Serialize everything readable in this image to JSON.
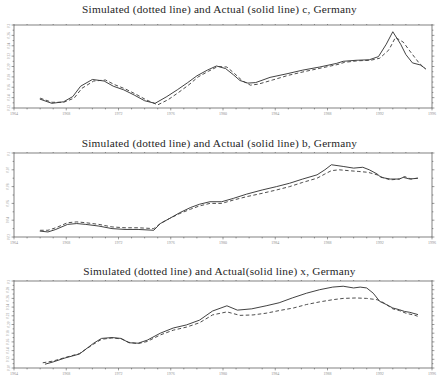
{
  "page": {
    "background": "#ffffff",
    "frame_color": "#4a4a4a",
    "solid_line_color": "#2d2d2d",
    "dashed_line_color": "#3a3a3a"
  },
  "chart_data": [
    {
      "type": "line",
      "id": "c",
      "title": "Simulated (dotted line) and Actual (solid line) c, Germany",
      "xlabel": "",
      "ylabel": "",
      "x_range": [
        1964,
        1996
      ],
      "x_tick_labels": [
        "1964",
        "1968",
        "1972",
        "1976",
        "1980",
        "1984",
        "1988",
        "1992",
        "1996"
      ],
      "ylim": [
        0.12,
        0.28
      ],
      "y_tick_labels": [
        "0.12",
        "0.14",
        "0.16",
        "0.18",
        "0.20",
        "0.22",
        "0.24",
        "0.26",
        "0.28"
      ],
      "grid": false,
      "legend_position": "none",
      "series": [
        {
          "name": "Actual",
          "style": "solid",
          "points": [
            [
              1966.0,
              0.137
            ],
            [
              1966.9,
              0.129
            ],
            [
              1967.8,
              0.132
            ],
            [
              1968.5,
              0.142
            ],
            [
              1969.1,
              0.162
            ],
            [
              1970.0,
              0.175
            ],
            [
              1970.9,
              0.172
            ],
            [
              1971.6,
              0.162
            ],
            [
              1972.4,
              0.155
            ],
            [
              1973.2,
              0.145
            ],
            [
              1974.0,
              0.134
            ],
            [
              1974.8,
              0.129
            ],
            [
              1975.7,
              0.142
            ],
            [
              1976.5,
              0.155
            ],
            [
              1977.3,
              0.169
            ],
            [
              1978.0,
              0.182
            ],
            [
              1978.8,
              0.193
            ],
            [
              1979.5,
              0.201
            ],
            [
              1980.2,
              0.196
            ],
            [
              1980.8,
              0.184
            ],
            [
              1981.3,
              0.173
            ],
            [
              1981.9,
              0.168
            ],
            [
              1982.5,
              0.169
            ],
            [
              1983.6,
              0.179
            ],
            [
              1984.9,
              0.186
            ],
            [
              1986.1,
              0.193
            ],
            [
              1987.4,
              0.199
            ],
            [
              1988.7,
              0.206
            ],
            [
              1989.2,
              0.21
            ],
            [
              1990.2,
              0.212
            ],
            [
              1991.2,
              0.213
            ],
            [
              1991.9,
              0.219
            ],
            [
              1992.5,
              0.243
            ],
            [
              1993.0,
              0.267
            ],
            [
              1993.6,
              0.243
            ],
            [
              1994.0,
              0.223
            ],
            [
              1994.5,
              0.207
            ],
            [
              1995.1,
              0.203
            ],
            [
              1995.5,
              0.196
            ]
          ]
        },
        {
          "name": "Simulated",
          "style": "dashed",
          "points": [
            [
              1966.0,
              0.139
            ],
            [
              1966.9,
              0.131
            ],
            [
              1967.8,
              0.131
            ],
            [
              1968.6,
              0.139
            ],
            [
              1969.2,
              0.158
            ],
            [
              1970.1,
              0.172
            ],
            [
              1971.0,
              0.174
            ],
            [
              1971.7,
              0.165
            ],
            [
              1972.5,
              0.157
            ],
            [
              1973.3,
              0.147
            ],
            [
              1974.1,
              0.136
            ],
            [
              1975.0,
              0.126
            ],
            [
              1975.8,
              0.136
            ],
            [
              1976.6,
              0.15
            ],
            [
              1977.4,
              0.165
            ],
            [
              1978.1,
              0.18
            ],
            [
              1978.9,
              0.191
            ],
            [
              1979.6,
              0.2
            ],
            [
              1980.3,
              0.199
            ],
            [
              1980.9,
              0.186
            ],
            [
              1981.5,
              0.172
            ],
            [
              1982.1,
              0.164
            ],
            [
              1982.7,
              0.166
            ],
            [
              1983.8,
              0.174
            ],
            [
              1985.0,
              0.183
            ],
            [
              1986.2,
              0.19
            ],
            [
              1987.5,
              0.197
            ],
            [
              1988.8,
              0.204
            ],
            [
              1989.3,
              0.208
            ],
            [
              1990.3,
              0.211
            ],
            [
              1991.3,
              0.212
            ],
            [
              1992.0,
              0.216
            ],
            [
              1992.7,
              0.232
            ],
            [
              1993.2,
              0.256
            ],
            [
              1993.8,
              0.247
            ],
            [
              1994.3,
              0.23
            ],
            [
              1995.0,
              0.207
            ],
            [
              1995.5,
              0.195
            ]
          ]
        }
      ]
    },
    {
      "type": "line",
      "id": "b",
      "title": "Simulated (dotted line) and Actual (solid line) b, Germany",
      "xlabel": "",
      "ylabel": "",
      "x_range": [
        1964,
        1996
      ],
      "x_tick_labels": [
        "1964",
        "1968",
        "1972",
        "1976",
        "1980",
        "1984",
        "1988",
        "1992",
        "1996"
      ],
      "ylim": [
        0.02,
        0.12
      ],
      "y_tick_labels": [
        "0.02",
        "0.04",
        "0.06",
        "0.08",
        "0.10",
        "0.12"
      ],
      "grid": false,
      "legend_position": "none",
      "series": [
        {
          "name": "Actual",
          "style": "solid",
          "points": [
            [
              1966.0,
              0.027
            ],
            [
              1966.6,
              0.026
            ],
            [
              1967.2,
              0.029
            ],
            [
              1968.1,
              0.035
            ],
            [
              1968.8,
              0.036
            ],
            [
              1969.5,
              0.035
            ],
            [
              1970.5,
              0.033
            ],
            [
              1971.5,
              0.03
            ],
            [
              1972.5,
              0.029
            ],
            [
              1973.5,
              0.029
            ],
            [
              1974.7,
              0.028
            ],
            [
              1975.2,
              0.036
            ],
            [
              1975.9,
              0.042
            ],
            [
              1976.7,
              0.049
            ],
            [
              1977.5,
              0.055
            ],
            [
              1978.2,
              0.059
            ],
            [
              1979.0,
              0.062
            ],
            [
              1979.9,
              0.062
            ],
            [
              1980.8,
              0.066
            ],
            [
              1981.8,
              0.071
            ],
            [
              1983.0,
              0.076
            ],
            [
              1984.1,
              0.08
            ],
            [
              1985.1,
              0.084
            ],
            [
              1986.1,
              0.089
            ],
            [
              1987.2,
              0.094
            ],
            [
              1987.8,
              0.1
            ],
            [
              1988.3,
              0.106
            ],
            [
              1989.2,
              0.104
            ],
            [
              1990.0,
              0.102
            ],
            [
              1990.7,
              0.103
            ],
            [
              1991.2,
              0.1
            ],
            [
              1991.8,
              0.095
            ],
            [
              1992.1,
              0.091
            ],
            [
              1992.8,
              0.089
            ],
            [
              1993.5,
              0.089
            ],
            [
              1993.8,
              0.091
            ],
            [
              1994.3,
              0.089
            ],
            [
              1994.9,
              0.09
            ]
          ]
        },
        {
          "name": "Simulated",
          "style": "dashed",
          "points": [
            [
              1966.0,
              0.028
            ],
            [
              1966.6,
              0.028
            ],
            [
              1967.2,
              0.031
            ],
            [
              1968.1,
              0.037
            ],
            [
              1968.8,
              0.038
            ],
            [
              1969.5,
              0.037
            ],
            [
              1970.5,
              0.035
            ],
            [
              1971.5,
              0.032
            ],
            [
              1972.5,
              0.031
            ],
            [
              1973.5,
              0.031
            ],
            [
              1974.7,
              0.03
            ],
            [
              1975.2,
              0.036
            ],
            [
              1975.9,
              0.042
            ],
            [
              1976.7,
              0.048
            ],
            [
              1977.5,
              0.053
            ],
            [
              1978.2,
              0.057
            ],
            [
              1979.0,
              0.06
            ],
            [
              1979.9,
              0.06
            ],
            [
              1980.8,
              0.064
            ],
            [
              1981.8,
              0.068
            ],
            [
              1983.0,
              0.072
            ],
            [
              1984.1,
              0.076
            ],
            [
              1985.1,
              0.08
            ],
            [
              1986.1,
              0.085
            ],
            [
              1987.2,
              0.09
            ],
            [
              1987.8,
              0.095
            ],
            [
              1988.3,
              0.099
            ],
            [
              1988.9,
              0.1
            ],
            [
              1989.6,
              0.099
            ],
            [
              1990.4,
              0.098
            ],
            [
              1991.1,
              0.097
            ],
            [
              1991.8,
              0.094
            ],
            [
              1992.2,
              0.091
            ],
            [
              1992.8,
              0.088
            ],
            [
              1993.5,
              0.089
            ],
            [
              1993.9,
              0.092
            ],
            [
              1994.4,
              0.089
            ],
            [
              1994.9,
              0.09
            ]
          ]
        }
      ]
    },
    {
      "type": "line",
      "id": "x",
      "title": "Simulated (dotted line) and Actual(solid line) x, Germany",
      "xlabel": "",
      "ylabel": "",
      "x_range": [
        1964,
        1996
      ],
      "x_tick_labels": [
        "1964",
        "1968",
        "1972",
        "1976",
        "1980",
        "1984",
        "1988",
        "1992",
        "1996"
      ],
      "ylim": [
        0.1,
        0.3
      ],
      "y_tick_labels": [
        "0.10",
        "0.12",
        "0.14",
        "0.16",
        "0.18",
        "0.20",
        "0.22",
        "0.24",
        "0.26",
        "0.28",
        "0.30"
      ],
      "grid": false,
      "legend_position": "none",
      "series": [
        {
          "name": "Actual",
          "style": "solid",
          "points": [
            [
              1966.4,
              0.109
            ],
            [
              1967.0,
              0.114
            ],
            [
              1967.9,
              0.123
            ],
            [
              1969.0,
              0.132
            ],
            [
              1970.1,
              0.157
            ],
            [
              1970.7,
              0.168
            ],
            [
              1971.5,
              0.17
            ],
            [
              1972.2,
              0.168
            ],
            [
              1972.8,
              0.158
            ],
            [
              1973.5,
              0.157
            ],
            [
              1974.2,
              0.164
            ],
            [
              1975.2,
              0.18
            ],
            [
              1976.2,
              0.192
            ],
            [
              1977.2,
              0.199
            ],
            [
              1978.2,
              0.21
            ],
            [
              1979.2,
              0.231
            ],
            [
              1980.3,
              0.243
            ],
            [
              1981.1,
              0.233
            ],
            [
              1982.2,
              0.236
            ],
            [
              1983.3,
              0.243
            ],
            [
              1984.3,
              0.25
            ],
            [
              1985.3,
              0.261
            ],
            [
              1986.4,
              0.272
            ],
            [
              1987.4,
              0.28
            ],
            [
              1988.4,
              0.286
            ],
            [
              1989.2,
              0.288
            ],
            [
              1990.0,
              0.284
            ],
            [
              1990.5,
              0.286
            ],
            [
              1991.0,
              0.284
            ],
            [
              1991.5,
              0.272
            ],
            [
              1992.0,
              0.253
            ],
            [
              1992.5,
              0.246
            ],
            [
              1993.0,
              0.238
            ],
            [
              1993.5,
              0.234
            ],
            [
              1993.9,
              0.23
            ],
            [
              1994.3,
              0.228
            ],
            [
              1994.9,
              0.223
            ]
          ]
        },
        {
          "name": "Simulated",
          "style": "dashed",
          "points": [
            [
              1966.2,
              0.112
            ],
            [
              1967.0,
              0.116
            ],
            [
              1967.9,
              0.124
            ],
            [
              1969.0,
              0.133
            ],
            [
              1970.1,
              0.155
            ],
            [
              1970.7,
              0.166
            ],
            [
              1971.5,
              0.169
            ],
            [
              1972.2,
              0.167
            ],
            [
              1972.8,
              0.159
            ],
            [
              1973.5,
              0.156
            ],
            [
              1974.2,
              0.161
            ],
            [
              1975.2,
              0.176
            ],
            [
              1976.2,
              0.187
            ],
            [
              1977.2,
              0.194
            ],
            [
              1978.2,
              0.204
            ],
            [
              1979.2,
              0.222
            ],
            [
              1980.3,
              0.229
            ],
            [
              1981.3,
              0.221
            ],
            [
              1982.3,
              0.222
            ],
            [
              1983.3,
              0.226
            ],
            [
              1984.3,
              0.232
            ],
            [
              1985.4,
              0.238
            ],
            [
              1986.4,
              0.246
            ],
            [
              1987.4,
              0.252
            ],
            [
              1988.4,
              0.257
            ],
            [
              1989.2,
              0.26
            ],
            [
              1990.2,
              0.261
            ],
            [
              1991.0,
              0.26
            ],
            [
              1991.8,
              0.257
            ],
            [
              1992.3,
              0.25
            ],
            [
              1993.0,
              0.236
            ],
            [
              1993.5,
              0.232
            ],
            [
              1994.0,
              0.226
            ],
            [
              1994.7,
              0.221
            ],
            [
              1994.9,
              0.219
            ]
          ]
        }
      ]
    }
  ]
}
